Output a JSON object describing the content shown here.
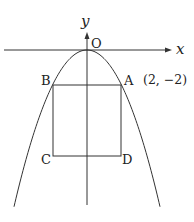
{
  "diagram": {
    "type": "coordinate-geometry",
    "curve": {
      "equation": "y = -x^2/2",
      "label": "parabola"
    },
    "axes": {
      "x_label": "x",
      "y_label": "y",
      "origin_label": "O"
    },
    "points": {
      "A": {
        "label": "A",
        "coord_label": "(2, −2)"
      },
      "B": {
        "label": "B"
      },
      "C": {
        "label": "C"
      },
      "D": {
        "label": "D"
      }
    },
    "shape": "square ABDC inscribed with top vertices on parabola",
    "colors": {
      "stroke": "#333333",
      "background": "#ffffff"
    }
  }
}
